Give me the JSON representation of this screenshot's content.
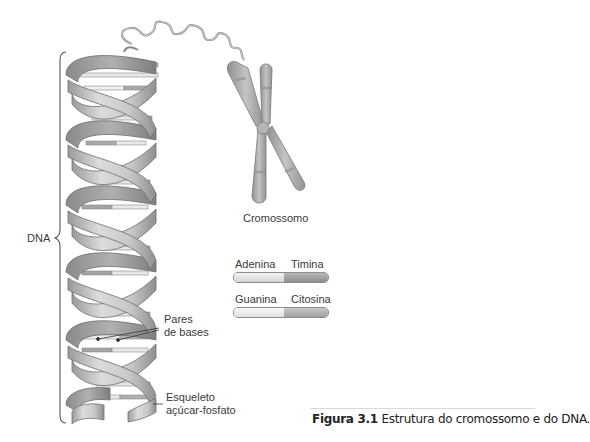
{
  "figure": {
    "labels": {
      "dna": "DNA",
      "chromosome": "Cromossomo",
      "base_pairs_line1": "Pares",
      "base_pairs_line2": "de bases",
      "backbone_line1": "Esqueleto",
      "backbone_line2": "açúcar-fosfato"
    },
    "legend": [
      {
        "left": "Adenina",
        "right": "Timina",
        "left_color": "#e6e6e6",
        "right_color": "#a3a3a3"
      },
      {
        "left": "Guanina",
        "right": "Citosina",
        "left_color": "#efefef",
        "right_color": "#b4b4b4"
      }
    ],
    "caption": {
      "number": "Figura 3.1",
      "text": " Estrutura do cromossomo e do DNA."
    },
    "colors": {
      "ribbon_light": "#d9d9d9",
      "ribbon_mid": "#b8b8b8",
      "ribbon_dark": "#8e8e8e",
      "outline": "#7a7a7a",
      "chromosome": "#a9a9a9"
    }
  }
}
